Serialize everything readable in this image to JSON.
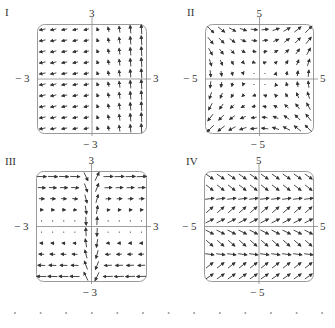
{
  "figure": {
    "panels": [
      {
        "id": "I",
        "label": "I",
        "box": {
          "x": 37,
          "y": 24,
          "w": 110,
          "h": 110
        },
        "label_pos": {
          "x": 5,
          "y": 6
        },
        "range": 3,
        "ticks": {
          "top": "3",
          "bottom": "− 3",
          "left": "− 3",
          "right": "3"
        },
        "grid": 10,
        "field": "I"
      },
      {
        "id": "II",
        "label": "II",
        "box": {
          "x": 205,
          "y": 24,
          "w": 109,
          "h": 110
        },
        "label_pos": {
          "x": 187,
          "y": 6
        },
        "range": 5,
        "ticks": {
          "top": "5",
          "bottom": "− 5",
          "left": "− 5",
          "right": "5"
        },
        "grid": 10,
        "field": "II"
      },
      {
        "id": "III",
        "label": "III",
        "box": {
          "x": 36,
          "y": 171,
          "w": 111,
          "h": 111
        },
        "label_pos": {
          "x": 5,
          "y": 155
        },
        "range": 3,
        "ticks": {
          "top": "3",
          "bottom": "− 3",
          "left": "− 3",
          "right": "3"
        },
        "grid": 10,
        "field": "III"
      },
      {
        "id": "IV",
        "label": "IV",
        "box": {
          "x": 204,
          "y": 171,
          "w": 110,
          "h": 111
        },
        "label_pos": {
          "x": 186,
          "y": 155
        },
        "range": 5,
        "ticks": {
          "top": "5",
          "bottom": "− 5",
          "left": "− 5",
          "right": "5"
        },
        "grid": 10,
        "field": "IV"
      }
    ],
    "colors": {
      "arrow": "#333333",
      "axis": "#888888",
      "frame": "#9a9a9a",
      "dot": "#999999"
    },
    "bottom_dots": 13
  }
}
